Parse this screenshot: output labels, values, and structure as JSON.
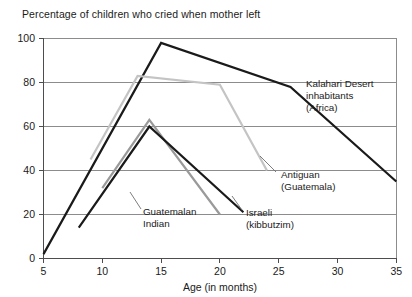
{
  "chart_data": {
    "type": "line",
    "title": "Percentage of children who cried when mother left",
    "xlabel": "Age (in months)",
    "ylabel": "",
    "xlim": [
      5,
      35
    ],
    "ylim": [
      0,
      100
    ],
    "xticks": [
      5,
      10,
      15,
      20,
      25,
      30,
      35
    ],
    "yticks": [
      0,
      20,
      40,
      60,
      80,
      100
    ],
    "grid": true,
    "legend_position": "inline-annotations",
    "series": [
      {
        "name": "Kalahari Desert inhabitants (Africa)",
        "color": "#1a1a1a",
        "linewidth": 2.2,
        "x": [
          5,
          15,
          26,
          35
        ],
        "y": [
          2,
          98,
          78,
          35
        ]
      },
      {
        "name": "Antiguan (Guatemala)",
        "color": "#c4c4c4",
        "linewidth": 2.2,
        "x": [
          9,
          13,
          20,
          24
        ],
        "y": [
          45,
          83,
          79,
          40
        ]
      },
      {
        "name": "Guatemalan Indian",
        "color": "#9a9a9a",
        "linewidth": 2.2,
        "x": [
          10,
          14,
          20
        ],
        "y": [
          32,
          63,
          20
        ]
      },
      {
        "name": "Israeli (kibbutzim)",
        "color": "#1a1a1a",
        "linewidth": 2.2,
        "x": [
          8,
          14,
          22
        ],
        "y": [
          14,
          60,
          21
        ]
      }
    ],
    "annotations": [
      {
        "id": "kalahari",
        "lines": [
          "Kalahari Desert",
          "inhabitants",
          "(Africa)"
        ],
        "x": 306,
        "y": 84
      },
      {
        "id": "antiguan",
        "lines": [
          "Antiguan",
          "(Guatemala)"
        ],
        "x": 278,
        "y": 175
      },
      {
        "id": "guatemalan",
        "lines": [
          "Guatemalan",
          "Indian"
        ],
        "x": 143,
        "y": 212
      },
      {
        "id": "israeli",
        "lines": [
          "Israeli",
          "(kibbutzim)"
        ],
        "x": 244,
        "y": 213
      }
    ]
  },
  "axis": {
    "y_100": "100",
    "y_80": "80",
    "y_60": "60",
    "y_40": "40",
    "y_20": "20",
    "y_0": "0",
    "x_5": "5",
    "x_10": "10",
    "x_15": "15",
    "x_20": "20",
    "x_25": "25",
    "x_30": "30",
    "x_35": "35"
  },
  "annotation_text": {
    "kalahari_l1": "Kalahari Desert",
    "kalahari_l2": "inhabitants",
    "kalahari_l3": "(Africa)",
    "antiguan_l1": "Antiguan",
    "antiguan_l2": "(Guatemala)",
    "guatemalan_l1": "Guatemalan",
    "guatemalan_l2": "Indian",
    "israeli_l1": "Israeli",
    "israeli_l2": "(kibbutzim)"
  }
}
